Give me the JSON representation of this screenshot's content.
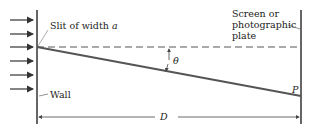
{
  "diagram": {
    "labels": {
      "slit": "Slit of width",
      "slit_var": "a",
      "screen_line1": "Screen or",
      "screen_line2": "photographic",
      "screen_line3": "plate",
      "angle": "θ",
      "point": "P",
      "wall": "Wall",
      "distance": "D"
    },
    "incident_arrows_count": 6,
    "colors": {
      "line": "#333333",
      "beam": "#555555",
      "dashed": "#555555",
      "text": "#222222"
    }
  }
}
